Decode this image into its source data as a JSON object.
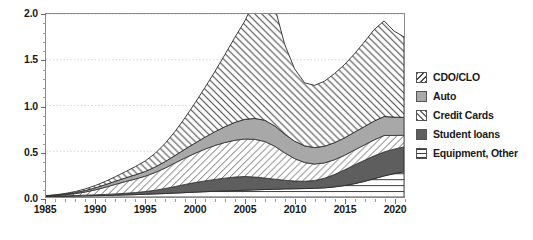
{
  "chart_data": {
    "type": "area",
    "stacked": true,
    "title": "",
    "subtitle": "",
    "xlabel": "",
    "ylabel": "",
    "xlim": [
      1985,
      2021
    ],
    "ylim": [
      0.0,
      2.0
    ],
    "grid": true,
    "grid_style": "dotted-horizontal",
    "legend_position": "right",
    "y_ticks": [
      "0.0",
      "0.5",
      "1.0",
      "1.5",
      "2.0"
    ],
    "y_tick_values": [
      0.0,
      0.5,
      1.0,
      1.5,
      2.0
    ],
    "y_minor_step": 0.1,
    "x_ticks": [
      "1985",
      "1990",
      "1995",
      "2000",
      "2005",
      "2010",
      "2015",
      "2020"
    ],
    "x_tick_values": [
      1985,
      1990,
      1995,
      2000,
      2005,
      2010,
      2015,
      2020
    ],
    "x_minor_step": 1,
    "x": [
      1985,
      1986,
      1987,
      1988,
      1989,
      1990,
      1991,
      1992,
      1993,
      1994,
      1995,
      1996,
      1997,
      1998,
      1999,
      2000,
      2001,
      2002,
      2003,
      2004,
      2005,
      2006,
      2007,
      2008,
      2009,
      2010,
      2011,
      2012,
      2013,
      2014,
      2015,
      2016,
      2017,
      2018,
      2019,
      2020,
      2021
    ],
    "stack_order_bottom_to_top": [
      "Equipment, Other",
      "Student loans",
      "Credit Cards",
      "Auto",
      "CDO/CLO"
    ],
    "series": [
      {
        "name": "Equipment, Other",
        "pattern": "horizontal-lines",
        "color": "#ffffff",
        "line_color": "#3a3a3a",
        "values": [
          0.005,
          0.007,
          0.009,
          0.011,
          0.013,
          0.015,
          0.017,
          0.02,
          0.023,
          0.026,
          0.03,
          0.034,
          0.038,
          0.043,
          0.048,
          0.053,
          0.058,
          0.062,
          0.066,
          0.07,
          0.074,
          0.078,
          0.082,
          0.085,
          0.088,
          0.09,
          0.092,
          0.095,
          0.1,
          0.11,
          0.125,
          0.145,
          0.17,
          0.2,
          0.23,
          0.255,
          0.275
        ]
      },
      {
        "name": "Student loans",
        "pattern": "solid",
        "color": "#5e5e5e",
        "line_color": "#2b2b2b",
        "values": [
          0.002,
          0.003,
          0.004,
          0.005,
          0.007,
          0.009,
          0.011,
          0.014,
          0.018,
          0.023,
          0.03,
          0.04,
          0.055,
          0.072,
          0.09,
          0.105,
          0.118,
          0.13,
          0.14,
          0.148,
          0.15,
          0.14,
          0.125,
          0.11,
          0.095,
          0.085,
          0.08,
          0.085,
          0.105,
          0.135,
          0.17,
          0.205,
          0.23,
          0.25,
          0.262,
          0.268,
          0.272
        ]
      },
      {
        "name": "Credit Cards",
        "pattern": "diagonal-forward",
        "color": "#ffffff",
        "line_color": "#3a3a3a",
        "values": [
          0.003,
          0.006,
          0.012,
          0.022,
          0.036,
          0.055,
          0.08,
          0.105,
          0.128,
          0.148,
          0.168,
          0.195,
          0.225,
          0.258,
          0.29,
          0.32,
          0.348,
          0.372,
          0.39,
          0.402,
          0.41,
          0.412,
          0.4,
          0.36,
          0.3,
          0.245,
          0.205,
          0.18,
          0.168,
          0.162,
          0.16,
          0.162,
          0.168,
          0.175,
          0.18,
          0.15,
          0.128
        ]
      },
      {
        "name": "Auto",
        "pattern": "solid",
        "color": "#a8a8a8",
        "line_color": "#3a3a3a",
        "values": [
          0.002,
          0.004,
          0.007,
          0.011,
          0.016,
          0.022,
          0.028,
          0.034,
          0.04,
          0.046,
          0.052,
          0.06,
          0.07,
          0.082,
          0.096,
          0.112,
          0.13,
          0.15,
          0.172,
          0.196,
          0.215,
          0.228,
          0.232,
          0.222,
          0.205,
          0.19,
          0.182,
          0.18,
          0.182,
          0.186,
          0.19,
          0.195,
          0.2,
          0.205,
          0.208,
          0.2,
          0.195
        ]
      },
      {
        "name": "CDO/CLO",
        "pattern": "diagonal-backward",
        "color": "#ffffff",
        "line_color": "#2b2b2b",
        "values": [
          0.003,
          0.005,
          0.008,
          0.012,
          0.018,
          0.026,
          0.036,
          0.05,
          0.068,
          0.09,
          0.115,
          0.15,
          0.2,
          0.265,
          0.345,
          0.44,
          0.545,
          0.66,
          0.79,
          0.93,
          1.075,
          1.3,
          1.48,
          1.3,
          0.98,
          0.79,
          0.69,
          0.68,
          0.71,
          0.755,
          0.8,
          0.855,
          0.925,
          1.0,
          1.045,
          0.94,
          0.88
        ]
      }
    ],
    "totals": [
      0.015,
      0.025,
      0.04,
      0.061,
      0.09,
      0.127,
      0.172,
      0.223,
      0.277,
      0.333,
      0.395,
      0.479,
      0.588,
      0.72,
      0.869,
      1.03,
      1.199,
      1.374,
      1.558,
      1.746,
      1.924,
      2.158,
      2.319,
      2.077,
      1.668,
      1.4,
      1.249,
      1.22,
      1.265,
      1.348,
      1.445,
      1.562,
      1.693,
      1.83,
      1.925,
      1.813,
      1.75
    ],
    "annotations": []
  },
  "legend": {
    "items": [
      {
        "label": "CDO/CLO",
        "swatch": "hatch-backslash-swatch"
      },
      {
        "label": "Auto",
        "swatch": "solid-gray-swatch"
      },
      {
        "label": "Credit Cards",
        "swatch": "hatch-slash-swatch"
      },
      {
        "label": "Student loans",
        "swatch": "solid-darkgray-swatch"
      },
      {
        "label": "Equipment, Other",
        "swatch": "horizontal-lines-swatch"
      }
    ]
  },
  "colors": {
    "auto": "#a8a8a8",
    "student_loans": "#5e5e5e",
    "axis": "#8a8a8a",
    "text": "#1a1a1a",
    "gridline": "#c9c9c9"
  }
}
